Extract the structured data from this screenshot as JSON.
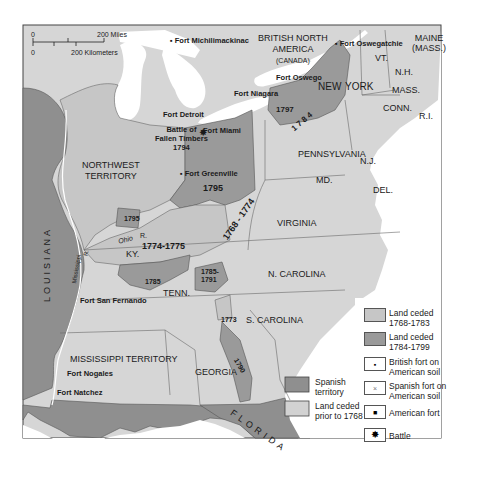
{
  "colors": {
    "land_ceded_prior_1768": "#d2d2d2",
    "land_ceded_1768_1783": "#c6c6c6",
    "land_ceded_1784_1799": "#9a9a9a",
    "spanish_territory": "#8f8f8f",
    "state_land": "#d6d6d6",
    "water": "#ffffff",
    "border": "#555555"
  },
  "scale_bar": {
    "zero_top": "0",
    "miles": "200 Miles",
    "zero_bottom": "0",
    "kilometers": "200 Kilometers"
  },
  "regions": {
    "british_north_america": "BRITISH NORTH",
    "british_north_america_2": "AMERICA",
    "canada": "(CANADA)",
    "maine": "MAINE",
    "maine_mass": "(MASS.)",
    "vt": "VT.",
    "nh": "N.H.",
    "mass": "MASS.",
    "conn": "CONN.",
    "ri": "R.I.",
    "new_york_1": "NEW",
    "new_york_2": "YORK",
    "pennsylvania": "PENNSYLVANIA",
    "nj": "N.J.",
    "md": "MD.",
    "del": "DEL.",
    "virginia": "VIRGINIA",
    "n_carolina": "N. CAROLINA",
    "s_carolina": "S. CAROLINA",
    "georgia": "GEORGIA",
    "florida": "FLORIDA",
    "louisiana": "LOUISIANA",
    "northwest_territory_1": "NORTHWEST",
    "northwest_territory_2": "TERRITORY",
    "mississippi_territory": "MISSISSIPPI TERRITORY",
    "ky": "KY.",
    "tenn": "TENN.",
    "ohio_r": "Ohio",
    "ohio_r2": "R.",
    "mississippi_r": "Mississippi",
    "mississippi_r2": "R."
  },
  "years": {
    "y1797": "1797",
    "y1784": "1 7 8 4",
    "y1795_main": "1795",
    "y1795_small": "1795",
    "y1774_1775": "1774-1775",
    "y1768_1774": "1768 - 1774",
    "y1785": "1785",
    "y1785_1791_a": "1785-",
    "y1785_1791_b": "1791",
    "y1773": "1773",
    "y1790": "1790"
  },
  "forts": {
    "michilimackinac": "Fort Michilimackinac",
    "oswegatchie": "Fort Oswegatchie",
    "oswego": "Fort Oswego",
    "niagara": "Fort Niagara",
    "detroit": "Fort Detroit",
    "miami": "Fort Miami",
    "greenville": "Fort Greenville",
    "san_fernando": "Fort San Fernando",
    "nogales": "Fort Nogales",
    "natchez": "Fort Natchez"
  },
  "battle": {
    "line1": "Battle of",
    "line2": "Fallen Timbers",
    "year": "1794"
  },
  "legend": {
    "items": [
      {
        "label1": "Land ceded",
        "label2": "1768-1783",
        "icon": "swatch-light"
      },
      {
        "label1": "Land ceded",
        "label2": "1784-1799",
        "icon": "swatch-dark"
      },
      {
        "label1": "British fort on",
        "label2": "American soil",
        "icon": "british-fort-icon"
      },
      {
        "label1": "Spanish fort on",
        "label2": "American soil",
        "icon": "spanish-fort-icon"
      },
      {
        "label1": "American fort",
        "label2": "",
        "icon": "american-fort-icon"
      },
      {
        "label1": "Battle",
        "label2": "",
        "icon": "battle-icon"
      }
    ],
    "spanish": {
      "label1": "Spanish",
      "label2": "territory"
    },
    "prior": {
      "label1": "Land ceded",
      "label2": "prior to 1768"
    }
  }
}
